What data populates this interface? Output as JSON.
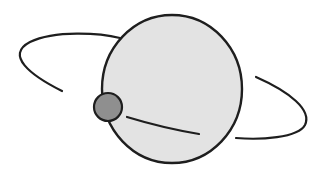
{
  "diagram": {
    "colors": {
      "background": "#ffffff",
      "planet_fill": "#e3e3e3",
      "moon_fill": "#8f8f8f",
      "stroke": "#1e1e1e"
    },
    "planet": {
      "cx": 172,
      "cy": 89,
      "rx": 70,
      "ry": 74
    },
    "moon": {
      "cx": 108,
      "cy": 107,
      "r": 14
    },
    "orbit_segments": [
      {
        "name": "orbit-back-left",
        "d": "M 62 91 C 30 75, 5 55, 30 42 C 55 30, 100 33, 120 38"
      },
      {
        "name": "orbit-front-inner",
        "d": "M 127 117 C 150 124, 175 130, 199 134"
      },
      {
        "name": "orbit-front-right",
        "d": "M 256 77 C 290 92, 312 110, 305 125 C 298 138, 260 140, 236 138"
      }
    ]
  }
}
